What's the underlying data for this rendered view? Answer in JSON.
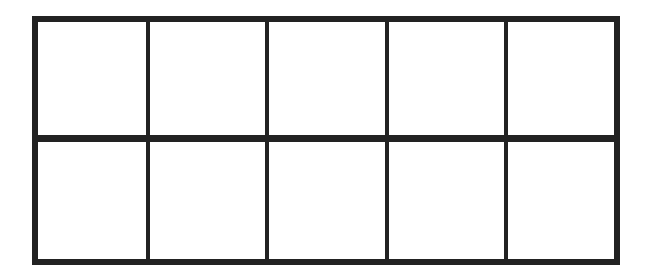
{
  "diagram": {
    "type": "ten-frame",
    "rows": 2,
    "columns": 5,
    "cells_filled": 0,
    "line_color": "#222222",
    "background_color": "#ffffff"
  }
}
